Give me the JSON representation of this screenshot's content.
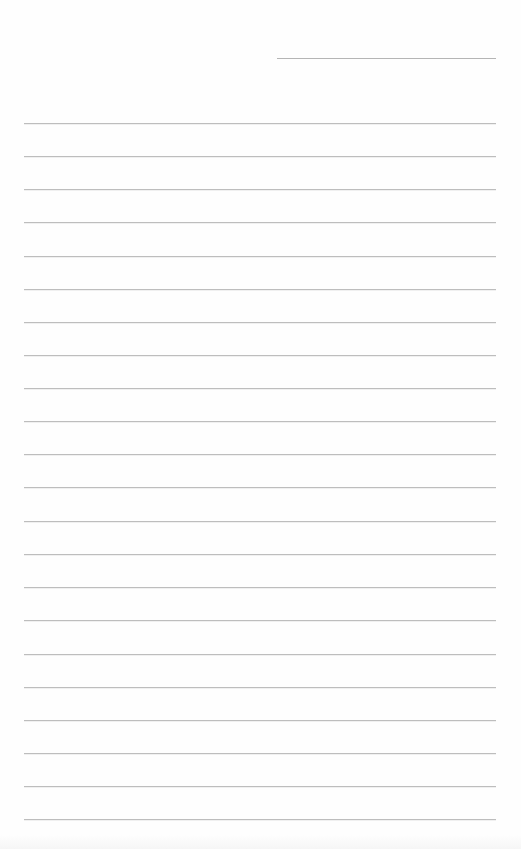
{
  "page": {
    "type": "blank lined writing paper",
    "background_color": "#fefefe",
    "line_color": "#bdbdbd"
  },
  "header_line": {
    "x_start": 277,
    "x_end": 496,
    "y": 58
  },
  "ruled_lines": {
    "count": 22,
    "x_start": 24,
    "x_end": 496,
    "y_positions": [
      123,
      156,
      189,
      222,
      256,
      289,
      322,
      355,
      388,
      421,
      454,
      487,
      521,
      554,
      587,
      620,
      654,
      687,
      720,
      753,
      786,
      819
    ]
  }
}
